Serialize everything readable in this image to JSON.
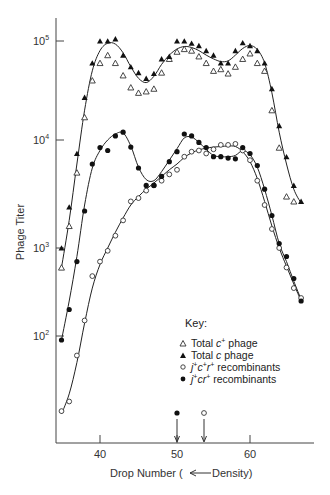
{
  "chart_data": {
    "type": "scatter",
    "title": "",
    "xlabel": "Drop Number (← Density)",
    "ylabel": "Phage Titer",
    "yscale": "log",
    "xlim": [
      34,
      68
    ],
    "ylim": [
      12,
      160000
    ],
    "x_ticks": [
      40,
      50,
      60
    ],
    "y_ticks": [
      {
        "value": 100,
        "label": "10",
        "exp": "2"
      },
      {
        "value": 1000,
        "label": "10",
        "exp": "3"
      },
      {
        "value": 10000,
        "label": "10",
        "exp": "4"
      },
      {
        "value": 100000,
        "label": "10",
        "exp": "5"
      }
    ],
    "grid": false,
    "legend": {
      "title": "Key:",
      "position": "lower-right",
      "entries": [
        {
          "marker": "open-triangle",
          "label_parts": [
            "Total ",
            "c",
            "+",
            " phage"
          ]
        },
        {
          "marker": "filled-triangle",
          "label_parts": [
            "Total ",
            "c",
            "",
            " phage"
          ]
        },
        {
          "marker": "open-circle",
          "label_parts": [
            "j",
            "+",
            "c",
            "+",
            "r",
            "+",
            " recombinants"
          ]
        },
        {
          "marker": "filled-circle",
          "label_parts": [
            "j",
            "+",
            "c",
            "",
            "r",
            "+",
            " recombinants"
          ]
        }
      ]
    },
    "annotations": [
      {
        "type": "arrow",
        "x": 50,
        "marker": "filled-circle",
        "note": "peak position j+cr+"
      },
      {
        "type": "arrow",
        "x": 53.5,
        "marker": "open-circle",
        "note": "peak position j+c+r+"
      }
    ],
    "series": [
      {
        "name": "Total c+ phage",
        "marker": "open-triangle",
        "points": [
          [
            35,
            600
          ],
          [
            36,
            1600
          ],
          [
            37,
            5000
          ],
          [
            38,
            17000
          ],
          [
            39,
            40000
          ],
          [
            40,
            60000
          ],
          [
            41,
            72000
          ],
          [
            42,
            60000
          ],
          [
            43,
            45000
          ],
          [
            44,
            34000
          ],
          [
            45,
            30000
          ],
          [
            46,
            31000
          ],
          [
            47,
            33000
          ],
          [
            48,
            48000
          ],
          [
            49,
            66000
          ],
          [
            50,
            78000
          ],
          [
            51,
            83000
          ],
          [
            52,
            80000
          ],
          [
            53,
            70000
          ],
          [
            54,
            60000
          ],
          [
            55,
            50000
          ],
          [
            56,
            52000
          ],
          [
            57,
            47000
          ],
          [
            58,
            55000
          ],
          [
            59,
            66000
          ],
          [
            60,
            75000
          ],
          [
            61,
            60000
          ],
          [
            62,
            50000
          ],
          [
            63,
            20000
          ],
          [
            64,
            8500
          ],
          [
            65,
            3000
          ],
          [
            66,
            2700
          ]
        ]
      },
      {
        "name": "Total c phage",
        "marker": "filled-triangle",
        "points": [
          [
            35,
            1000
          ],
          [
            36,
            2400
          ],
          [
            37,
            7500
          ],
          [
            38,
            27000
          ],
          [
            39,
            60000
          ],
          [
            40,
            100000
          ],
          [
            41,
            100000
          ],
          [
            42,
            105000
          ],
          [
            43,
            72000
          ],
          [
            44,
            55000
          ],
          [
            45,
            48000
          ],
          [
            46,
            42000
          ],
          [
            47,
            47000
          ],
          [
            48,
            66000
          ],
          [
            49,
            70000
          ],
          [
            50,
            100000
          ],
          [
            51,
            100000
          ],
          [
            52,
            95000
          ],
          [
            53,
            90000
          ],
          [
            54,
            80000
          ],
          [
            55,
            72000
          ],
          [
            56,
            60000
          ],
          [
            57,
            60000
          ],
          [
            58,
            80000
          ],
          [
            59,
            96000
          ],
          [
            60,
            90000
          ],
          [
            61,
            80000
          ],
          [
            62,
            60000
          ],
          [
            63,
            33000
          ],
          [
            64,
            14000
          ],
          [
            65,
            7000
          ],
          [
            66,
            3800
          ],
          [
            67,
            2700
          ]
        ]
      },
      {
        "name": "j+c+r+ recombinants",
        "marker": "open-circle",
        "points": [
          [
            35,
            14
          ],
          [
            36,
            18
          ],
          [
            37,
            60
          ],
          [
            38,
            150
          ],
          [
            39,
            480
          ],
          [
            40,
            700
          ],
          [
            41,
            930
          ],
          [
            42,
            1300
          ],
          [
            43,
            1800
          ],
          [
            44,
            2700
          ],
          [
            45,
            2900
          ],
          [
            46,
            3400
          ],
          [
            47,
            3800
          ],
          [
            48,
            4200
          ],
          [
            49,
            4800
          ],
          [
            50,
            5300
          ],
          [
            51,
            7000
          ],
          [
            52,
            7800
          ],
          [
            53,
            8000
          ],
          [
            54,
            7500
          ],
          [
            55,
            8200
          ],
          [
            56,
            9000
          ],
          [
            57,
            9000
          ],
          [
            58,
            9200
          ],
          [
            59,
            8000
          ],
          [
            60,
            6500
          ],
          [
            61,
            4200
          ],
          [
            62,
            2500
          ],
          [
            63,
            1500
          ],
          [
            64,
            1000
          ],
          [
            65,
            600
          ],
          [
            66,
            350
          ],
          [
            67,
            270
          ]
        ]
      },
      {
        "name": "j+cr+ recombinants",
        "marker": "filled-circle",
        "points": [
          [
            35,
            90
          ],
          [
            36,
            200
          ],
          [
            37,
            700
          ],
          [
            38,
            2200
          ],
          [
            39,
            6000
          ],
          [
            40,
            8500
          ],
          [
            41,
            8000
          ],
          [
            42,
            11000
          ],
          [
            43,
            12000
          ],
          [
            44,
            8600
          ],
          [
            45,
            5500
          ],
          [
            46,
            3800
          ],
          [
            47,
            3800
          ],
          [
            48,
            4600
          ],
          [
            49,
            6300
          ],
          [
            50,
            7800
          ],
          [
            51,
            11500
          ],
          [
            52,
            11000
          ],
          [
            53,
            9500
          ],
          [
            54,
            8500
          ],
          [
            55,
            7000
          ],
          [
            56,
            7000
          ],
          [
            57,
            6800
          ],
          [
            58,
            6700
          ],
          [
            59,
            8500
          ],
          [
            60,
            7500
          ],
          [
            61,
            5800
          ],
          [
            62,
            3500
          ],
          [
            63,
            2000
          ],
          [
            64,
            1100
          ],
          [
            65,
            800
          ],
          [
            66,
            450
          ],
          [
            67,
            250
          ]
        ]
      }
    ],
    "fit_curves": [
      {
        "name": "Total phage fit",
        "points": [
          [
            35,
            600
          ],
          [
            36,
            1800
          ],
          [
            37,
            6000
          ],
          [
            38,
            20000
          ],
          [
            39,
            50000
          ],
          [
            40,
            80000
          ],
          [
            41,
            95000
          ],
          [
            42,
            93000
          ],
          [
            43,
            76000
          ],
          [
            44,
            55000
          ],
          [
            45,
            42000
          ],
          [
            46,
            38000
          ],
          [
            47,
            44000
          ],
          [
            48,
            58000
          ],
          [
            49,
            72000
          ],
          [
            50,
            83000
          ],
          [
            51,
            88000
          ],
          [
            52,
            86000
          ],
          [
            53,
            80000
          ],
          [
            54,
            72000
          ],
          [
            55,
            66000
          ],
          [
            56,
            62000
          ],
          [
            57,
            63000
          ],
          [
            58,
            72000
          ],
          [
            59,
            84000
          ],
          [
            60,
            90000
          ],
          [
            61,
            82000
          ],
          [
            62,
            60000
          ],
          [
            63,
            30000
          ],
          [
            64,
            12000
          ],
          [
            65,
            6000
          ],
          [
            66,
            3500
          ],
          [
            67,
            2600
          ]
        ]
      },
      {
        "name": "j+cr+ fit",
        "points": [
          [
            35,
            90
          ],
          [
            36,
            250
          ],
          [
            37,
            800
          ],
          [
            38,
            2500
          ],
          [
            39,
            5500
          ],
          [
            40,
            8000
          ],
          [
            41,
            10000
          ],
          [
            42,
            11500
          ],
          [
            43,
            11800
          ],
          [
            44,
            8800
          ],
          [
            45,
            5600
          ],
          [
            46,
            4300
          ],
          [
            47,
            4200
          ],
          [
            48,
            5100
          ],
          [
            49,
            6500
          ],
          [
            50,
            8300
          ],
          [
            51,
            10500
          ],
          [
            52,
            10700
          ],
          [
            53,
            9500
          ],
          [
            54,
            8200
          ],
          [
            55,
            7200
          ],
          [
            56,
            7000
          ],
          [
            57,
            7000
          ],
          [
            58,
            7200
          ],
          [
            59,
            8000
          ],
          [
            60,
            7300
          ],
          [
            61,
            5600
          ],
          [
            62,
            3500
          ],
          [
            63,
            2000
          ],
          [
            64,
            1100
          ],
          [
            65,
            700
          ],
          [
            66,
            420
          ],
          [
            67,
            260
          ]
        ]
      },
      {
        "name": "j+c+r+ fit",
        "points": [
          [
            35,
            13
          ],
          [
            36,
            22
          ],
          [
            37,
            50
          ],
          [
            38,
            140
          ],
          [
            39,
            350
          ],
          [
            40,
            650
          ],
          [
            41,
            1000
          ],
          [
            42,
            1400
          ],
          [
            43,
            1900
          ],
          [
            44,
            2500
          ],
          [
            45,
            3000
          ],
          [
            46,
            3500
          ],
          [
            47,
            4000
          ],
          [
            48,
            4600
          ],
          [
            49,
            5300
          ],
          [
            50,
            6000
          ],
          [
            51,
            6900
          ],
          [
            52,
            7600
          ],
          [
            53,
            8100
          ],
          [
            54,
            8400
          ],
          [
            55,
            8600
          ],
          [
            56,
            8700
          ],
          [
            57,
            8800
          ],
          [
            58,
            8700
          ],
          [
            59,
            7800
          ],
          [
            60,
            6300
          ],
          [
            61,
            4400
          ],
          [
            62,
            2700
          ],
          [
            63,
            1600
          ],
          [
            64,
            1000
          ],
          [
            65,
            620
          ],
          [
            66,
            390
          ],
          [
            67,
            250
          ]
        ]
      }
    ]
  },
  "labels": {
    "y_axis_title": "Phage Titer",
    "x_axis_title": "Drop Number (",
    "x_axis_arrow": "←",
    "x_axis_title_end": "Density)",
    "key_title": "Key:",
    "key_rows": [
      {
        "pre": "Total ",
        "it": "c",
        "sup": "+",
        "post": " phage"
      },
      {
        "pre": "Total ",
        "it": "c",
        "sup": "",
        "post": " phage"
      },
      {
        "it1": "j",
        "sup1": "+",
        "it2": "c",
        "sup2": "+",
        "it3": "r",
        "sup3": "+",
        "post": " recombinants"
      },
      {
        "it1": "j",
        "sup1": "+",
        "it2": "c",
        "sup2": "",
        "it3": "r",
        "sup3": "+",
        "post": " recombinants"
      }
    ],
    "x_ticks": [
      "40",
      "50",
      "60"
    ],
    "y_ticks": [
      {
        "base": "10",
        "exp": "5"
      },
      {
        "base": "10",
        "exp": "4"
      },
      {
        "base": "10",
        "exp": "3"
      },
      {
        "base": "10",
        "exp": "2"
      }
    ]
  }
}
